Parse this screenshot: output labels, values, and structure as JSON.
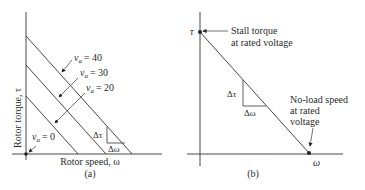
{
  "diagram_a": {
    "caption": "(a)",
    "x_axis_label": "Rotor speed, ω",
    "y_axis_label": "Rotor torque, τ",
    "curves": [
      {
        "label_var": "v",
        "label_sub": "a",
        "label_value": "= 40"
      },
      {
        "label_var": "v",
        "label_sub": "a",
        "label_value": "= 30"
      },
      {
        "label_var": "v",
        "label_sub": "a",
        "label_value": "= 20"
      },
      {
        "label_var": "v",
        "label_sub": "a",
        "label_value": "= 0"
      }
    ],
    "slope_labels": {
      "dtau": "Δτ",
      "domega": "Δω"
    }
  },
  "diagram_b": {
    "caption": "(b)",
    "x_axis_symbol": "ω",
    "y_axis_symbol": "τ",
    "annotation_stall_line1": "Stall torque",
    "annotation_stall_line2": "at rated voltage",
    "annotation_noload_line1": "No-load speed",
    "annotation_noload_line2": "at rated",
    "annotation_noload_line3": "voltage",
    "slope_labels": {
      "dtau": "Δτ",
      "domega": "Δω"
    }
  }
}
